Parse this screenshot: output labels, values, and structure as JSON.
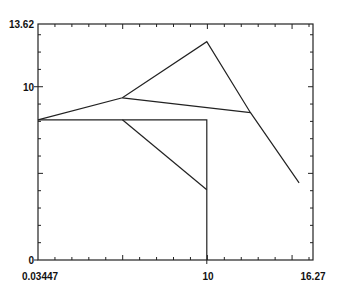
{
  "chart_data": {
    "type": "line",
    "title": "",
    "xlabel": "",
    "ylabel": "",
    "xlim": [
      0.03447,
      16.27
    ],
    "ylim": [
      0,
      13.62
    ],
    "x_tick_labels": [
      "0.03447",
      "10",
      "16.27"
    ],
    "y_tick_labels": [
      "0",
      "10",
      "13.62"
    ],
    "grid": false,
    "legend": null,
    "series": [
      {
        "name": "polyline-1",
        "points": [
          [
            0.034,
            8.09
          ],
          [
            5.02,
            9.36
          ],
          [
            10.0,
            12.6
          ],
          [
            12.58,
            8.5
          ],
          [
            15.45,
            4.45
          ]
        ]
      },
      {
        "name": "segment-2",
        "points": [
          [
            5.02,
            9.36
          ],
          [
            12.58,
            8.5
          ]
        ]
      },
      {
        "name": "polyline-3",
        "points": [
          [
            0.034,
            8.09
          ],
          [
            10.0,
            8.09
          ],
          [
            10.0,
            0
          ]
        ]
      },
      {
        "name": "segment-4",
        "points": [
          [
            5.02,
            8.09
          ],
          [
            10.0,
            4.05
          ]
        ]
      }
    ]
  },
  "axes": {
    "x": {
      "min_label": "0.03447",
      "mid_label": "10",
      "max_label": "16.27"
    },
    "y": {
      "min_label": "0",
      "mid_label": "10",
      "max_label": "13.62"
    }
  }
}
